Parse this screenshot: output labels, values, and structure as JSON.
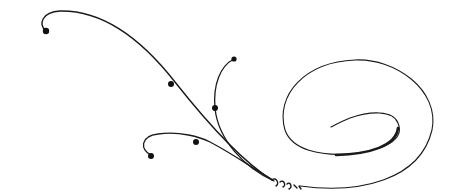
{
  "image": {
    "description": "Decorative calligraphic flourish: several curling tendrils with dot terminals converging at a small twisted knot, flowing into a large elliptical spiral on the right",
    "background": "#ffffff",
    "stroke_color": "#1a1a1a",
    "elements": [
      {
        "name": "top-left-tendril",
        "terminal": "dot"
      },
      {
        "name": "upper-middle-tendril",
        "terminal": "dot"
      },
      {
        "name": "lower-left-tendril",
        "terminal": "dot"
      },
      {
        "name": "knot-twist"
      },
      {
        "name": "outer-spiral-loop"
      },
      {
        "name": "inner-spiral-swash"
      }
    ]
  }
}
